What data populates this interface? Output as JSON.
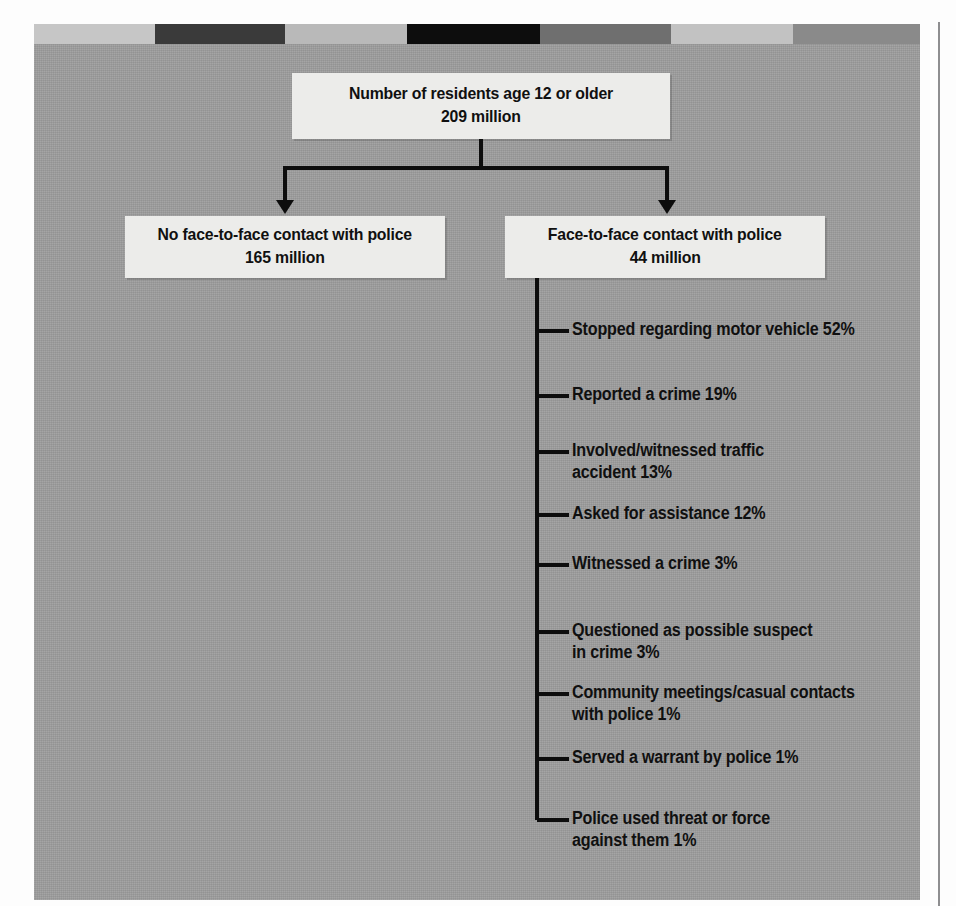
{
  "figure": {
    "title_box": {
      "line1": "Number of residents age 12 or older",
      "line2": "209 million"
    },
    "branches": [
      {
        "name": "no-contact",
        "line1": "No face-to-face contact with police",
        "line2": "165 million"
      },
      {
        "name": "contact",
        "line1": "Face-to-face contact with police",
        "line2": "44 million"
      }
    ],
    "contact_reasons": [
      {
        "label": "Stopped regarding motor vehicle 52%",
        "top": 318,
        "tick": 329
      },
      {
        "label": "Reported a crime 19%",
        "top": 383,
        "tick": 394
      },
      {
        "label": "Involved/witnessed traffic\naccident 13%",
        "top": 439,
        "tick": 450
      },
      {
        "label": "Asked for assistance 12%",
        "top": 502,
        "tick": 513
      },
      {
        "label": "Witnessed a crime 3%",
        "top": 552,
        "tick": 563
      },
      {
        "label": "Questioned as possible suspect\nin crime 3%",
        "top": 619,
        "tick": 630
      },
      {
        "label": "Community meetings/casual contacts\nwith police 1%",
        "top": 681,
        "tick": 692
      },
      {
        "label": "Served a warrant by police 1%",
        "top": 746,
        "tick": 757
      },
      {
        "label": "Police used threat or force\nagainst them 1%",
        "top": 807,
        "tick": 818
      }
    ],
    "top_band_segments": [
      {
        "color": "#c6c6c6",
        "width": 121
      },
      {
        "color": "#3a3a3a",
        "width": 130
      },
      {
        "color": "#b9b9b9",
        "width": 122
      },
      {
        "color": "#0d0d0d",
        "width": 133
      },
      {
        "color": "#6f6f6f",
        "width": 131
      },
      {
        "color": "#c2c2c2",
        "width": 122
      },
      {
        "color": "#8a8a8a",
        "width": 127
      }
    ],
    "colors": {
      "panel_background": "#9d9d9d",
      "box_fill": "#ececea",
      "ink": "#0d0d0d",
      "page_rule": "#8e8e90"
    }
  },
  "chart_data": {
    "type": "diagram",
    "title": "Number of residents age 12 or older",
    "total": "209 million",
    "categories": [
      "No face-to-face contact with police",
      "Face-to-face contact with police"
    ],
    "values": [
      "165 million",
      "44 million"
    ],
    "breakdown_parent": "Face-to-face contact with police",
    "breakdown_labels": [
      "Stopped regarding motor vehicle",
      "Reported a crime",
      "Involved/witnessed traffic accident",
      "Asked for assistance",
      "Witnessed a crime",
      "Questioned as possible suspect in crime",
      "Community meetings/casual contacts with police",
      "Served a warrant by police",
      "Police used threat or force against them"
    ],
    "breakdown_values": [
      52,
      19,
      13,
      12,
      3,
      3,
      1,
      1,
      1
    ],
    "breakdown_unit": "%",
    "xlabel": "",
    "ylabel": "",
    "legend": [],
    "grid": false
  }
}
